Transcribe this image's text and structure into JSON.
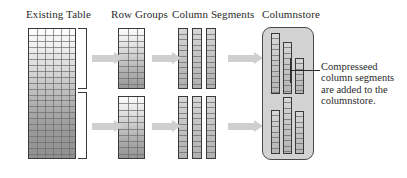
{
  "diagram": {
    "stage_labels": [
      {
        "id": "existing-table",
        "text": "Existing Table"
      },
      {
        "id": "row-groups",
        "text": "Row Groups"
      },
      {
        "id": "column-segments",
        "text": "Column Segments"
      },
      {
        "id": "columnstore",
        "text": "Columnstore"
      }
    ],
    "callout": {
      "lines": [
        "Compresseed",
        "column segments",
        "are added to the",
        "columnstore."
      ]
    },
    "colors": {
      "ink": "#2b2b2b",
      "stroke": "#3a3a3a",
      "arrow": "#cfcfcf",
      "store_fill": "#d2d2d2",
      "grid_line": "#6e6e6e",
      "page_background": "#ffffff"
    },
    "structure": {
      "existing_table": {
        "columns": 6,
        "rows": 22,
        "gradient": "light-top-to-dark-bottom"
      },
      "row_groups": [
        {
          "index": 1,
          "columns": 3,
          "rows": 10
        },
        {
          "index": 2,
          "columns": 3,
          "rows": 10
        }
      ],
      "column_segments_per_group": 3,
      "columnstore_segments": [
        {
          "group": "top",
          "index": 1,
          "cells": 12
        },
        {
          "group": "top",
          "index": 2,
          "cells": 10
        },
        {
          "group": "top",
          "index": 3,
          "cells": 7
        },
        {
          "group": "bottom",
          "index": 1,
          "cells": 8
        },
        {
          "group": "bottom",
          "index": 2,
          "cells": 11
        },
        {
          "group": "bottom",
          "index": 3,
          "cells": 8
        }
      ],
      "arrow_count": 6
    }
  }
}
